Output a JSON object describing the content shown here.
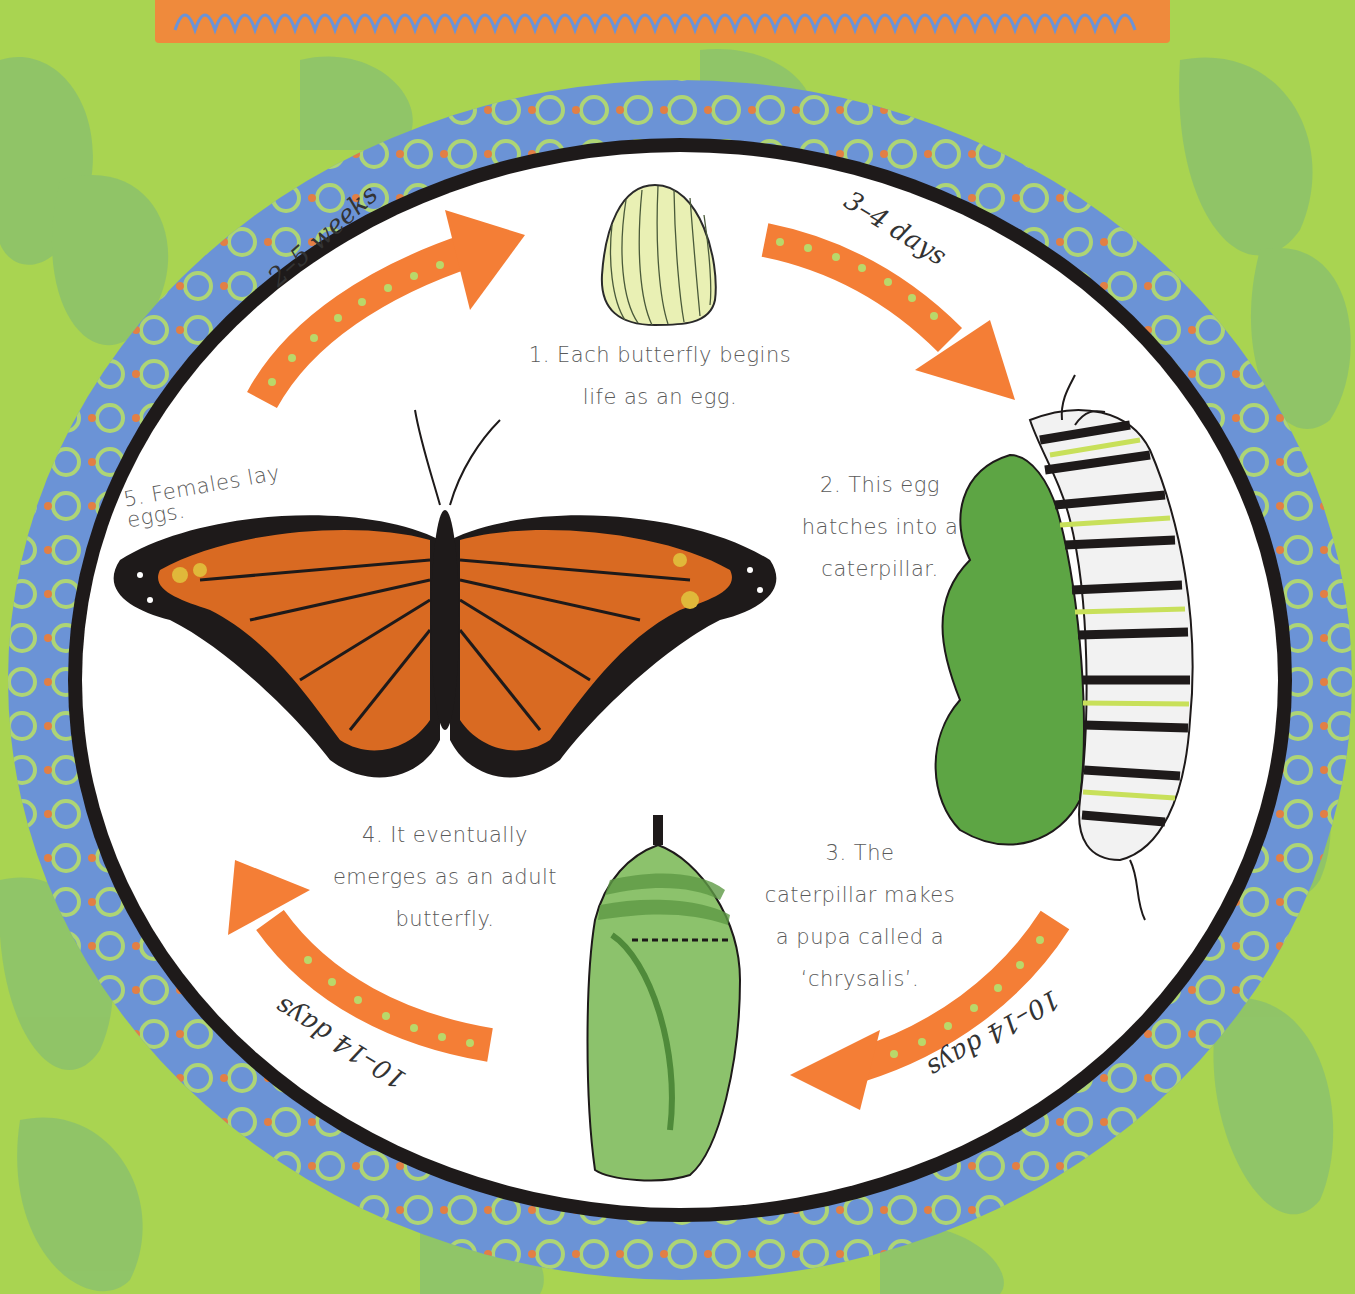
{
  "diagram": {
    "type": "cycle",
    "colors": {
      "background_green": "#a9d451",
      "background_leaf": "#8cc26c",
      "ring_blue": "#6b93d6",
      "ring_swirl": "#b5dc6a",
      "ring_dot": "#ef7d35",
      "ring_outline": "#1e1a1a",
      "center_white": "#ffffff",
      "arrow_orange": "#f47e36",
      "arrow_dot": "#b9d86a",
      "text_gray": "#5a5a5a",
      "banner_orange": "#ef8a3c"
    },
    "stages": [
      {
        "id": "egg",
        "step": "1",
        "lines": [
          "1. Each butterfly begins",
          "life as an egg."
        ]
      },
      {
        "id": "caterpillar",
        "step": "2",
        "lines": [
          "2. This egg",
          "hatches into a",
          "caterpillar."
        ]
      },
      {
        "id": "chrysalis",
        "step": "3",
        "lines": [
          "3. The",
          "caterpillar makes",
          "a pupa called a",
          "‘chrysalis’."
        ]
      },
      {
        "id": "butterfly",
        "step": "4",
        "lines": [
          "4. It eventually",
          "emerges as an adult",
          "butterfly."
        ]
      },
      {
        "id": "lay-eggs",
        "step": "5",
        "lines": [
          "5. Females lay eggs."
        ]
      }
    ],
    "transitions": [
      {
        "from": "butterfly",
        "to": "egg",
        "label": "2–5 weeks"
      },
      {
        "from": "egg",
        "to": "caterpillar",
        "label": "3–4 days"
      },
      {
        "from": "caterpillar",
        "to": "chrysalis",
        "label": "10–14 days"
      },
      {
        "from": "chrysalis",
        "to": "butterfly",
        "label": "10–14 days"
      }
    ]
  }
}
